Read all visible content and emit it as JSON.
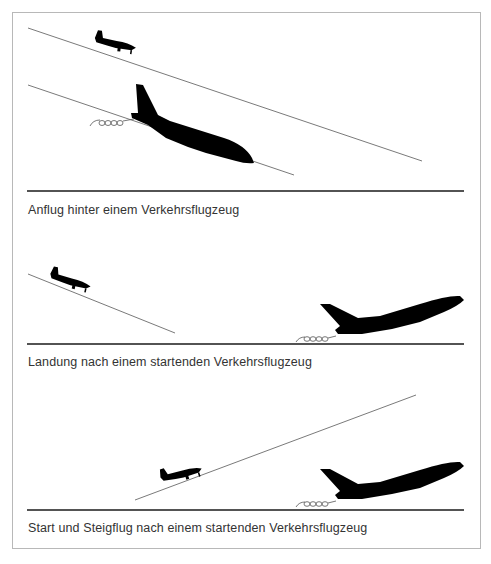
{
  "colors": {
    "aircraft": "#000000",
    "path_line": "#7a7a7a",
    "ground_line": "#1a1a1a",
    "frame": "#b8b8b8",
    "caption_text": "#333333"
  },
  "panels": [
    {
      "id": "approach",
      "caption": "Anflug hinter einem Verkehrsflugzeug",
      "elements": [
        "small-aircraft-descending",
        "airliner-descending",
        "wake-vortex",
        "two-approach-paths",
        "ground-line"
      ]
    },
    {
      "id": "landing",
      "caption": "Landung nach einem startenden Verkehrsflugzeug",
      "elements": [
        "small-aircraft-descending",
        "airliner-taking-off",
        "wake-vortex",
        "approach-path",
        "runway-line"
      ]
    },
    {
      "id": "takeoff",
      "caption": "Start und Steigflug nach einem startenden Verkehrsflugzeug",
      "elements": [
        "small-aircraft-climbing",
        "airliner-taking-off",
        "wake-vortex",
        "climb-path",
        "runway-line"
      ]
    }
  ],
  "icons": {
    "small_aircraft": "small-aircraft-silhouette",
    "airliner": "airliner-silhouette",
    "wake": "wake-vortex-squiggle"
  }
}
